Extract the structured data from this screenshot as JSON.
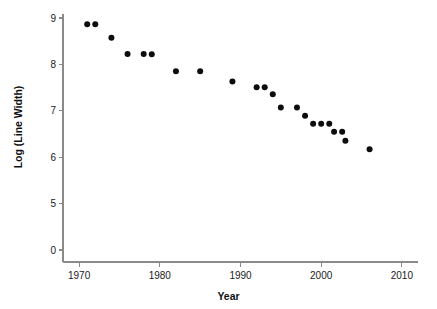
{
  "chart_data": {
    "type": "scatter",
    "title": "",
    "xlabel": "Year",
    "ylabel": "Log  (Line Width)",
    "xlim": [
      1968,
      2012
    ],
    "ylim": [
      -0.45,
      9.7
    ],
    "xticks": [
      1970,
      1980,
      1990,
      2000,
      2010
    ],
    "xticklabels": [
      "1970",
      "1980",
      "1990",
      "2000",
      "2010"
    ],
    "yticks": [
      9,
      8,
      7,
      6,
      5,
      0
    ],
    "yticklabels": [
      "9",
      "8",
      "7",
      "6",
      "5",
      "0"
    ],
    "grid": false,
    "legend": null,
    "marker": "filled-circle",
    "marker_color": "#0d0d0d",
    "points": [
      {
        "x": 1971,
        "y": 9.2
      },
      {
        "x": 1972,
        "y": 9.2
      },
      {
        "x": 1974,
        "y": 8.65
      },
      {
        "x": 1976,
        "y": 7.99
      },
      {
        "x": 1978,
        "y": 7.99
      },
      {
        "x": 1979,
        "y": 7.98
      },
      {
        "x": 1982,
        "y": 7.29
      },
      {
        "x": 1985,
        "y": 7.29
      },
      {
        "x": 1989,
        "y": 6.88
      },
      {
        "x": 1992,
        "y": 6.64
      },
      {
        "x": 1993,
        "y": 6.64
      },
      {
        "x": 1994,
        "y": 6.36
      },
      {
        "x": 1995,
        "y": 5.82
      },
      {
        "x": 1997,
        "y": 5.82
      },
      {
        "x": 1998,
        "y": 5.49
      },
      {
        "x": 1999,
        "y": 5.16
      },
      {
        "x": 2000,
        "y": 5.16
      },
      {
        "x": 2001,
        "y": 5.16
      },
      {
        "x": 2001.6,
        "y": 4.84
      },
      {
        "x": 2002.6,
        "y": 4.84
      },
      {
        "x": 2003,
        "y": 4.47
      },
      {
        "x": 2006,
        "y": 4.13
      }
    ]
  },
  "axis": {
    "x_title": "Year",
    "y_title": "Log  (Line Width)"
  }
}
